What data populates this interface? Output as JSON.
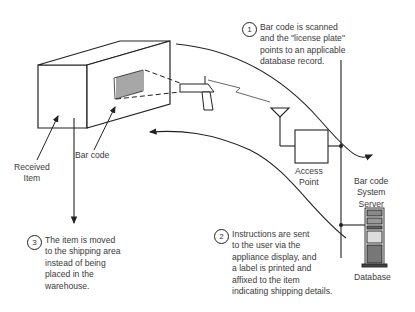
{
  "labels": {
    "received_item": [
      "Received",
      "Item"
    ],
    "bar_code": "Bar code",
    "access_point": [
      "Access",
      "Point"
    ],
    "server": [
      "Bar code",
      "System",
      "Server"
    ],
    "database": "Database"
  },
  "steps": [
    {
      "number": "1",
      "lines": [
        "Bar code is scanned",
        "and the \"license plate\"",
        "points to an applicable",
        "database record."
      ]
    },
    {
      "number": "2",
      "lines": [
        "Instructions are sent",
        "to the user via the",
        "appliance display, and",
        "a label is printed and",
        "affixed to the item",
        "indicating shipping details."
      ]
    },
    {
      "number": "3",
      "lines": [
        "The item is moved",
        "to the shipping area",
        "instead of being",
        "placed in the",
        "warehouse."
      ]
    }
  ]
}
